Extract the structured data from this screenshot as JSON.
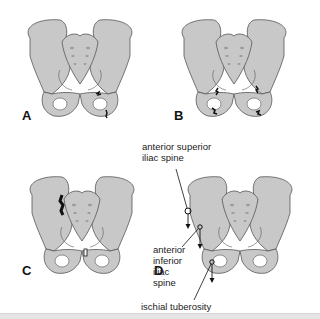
{
  "figure": {
    "bone_color": "#c8c8c8",
    "outline_color": "#555555",
    "fracture_color": "#111111",
    "panels": [
      {
        "letter": "A",
        "description": "pelvis with pubic rami fractures"
      },
      {
        "letter": "B",
        "description": "pelvis with bilateral rami and ischial fractures"
      },
      {
        "letter": "C",
        "description": "pelvis with sacroiliac disruption and symphysis widening"
      },
      {
        "letter": "D",
        "description": "avulsion sites"
      }
    ],
    "labels": {
      "asis_line1": "anterior superior",
      "asis_line2": "iliac spine",
      "aiis_line1": "anterior",
      "aiis_line2": "inferior",
      "aiis_line3": "iliac",
      "aiis_line4": "spine",
      "ischial": "ischial tuberosity"
    }
  }
}
